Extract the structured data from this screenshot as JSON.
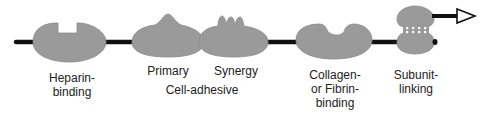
{
  "colors": {
    "domain_fill": "#9a9a9a",
    "domain_stroke": "#7a7a7a",
    "backbone": "#111111",
    "background": "#ffffff",
    "text": "#222222"
  },
  "domains": [
    {
      "id": "heparin-binding",
      "label_lines": [
        "Heparin-",
        "binding"
      ],
      "feature": "notch"
    },
    {
      "id": "primary",
      "label_lines": [
        "Primary"
      ],
      "feature": "single-peak"
    },
    {
      "id": "synergy",
      "label_lines": [
        "Synergy"
      ],
      "feature": "triple-peak"
    },
    {
      "id": "collagen-fibrin-binding",
      "label_lines": [
        "Collagen-",
        "or Fibrin-",
        "binding"
      ],
      "feature": "rounded-notch"
    },
    {
      "id": "subunit-linking",
      "label_lines": [
        "Subunit-",
        "linking"
      ],
      "feature": "disulfide-bonds"
    }
  ],
  "group_labels": [
    {
      "id": "cell-adhesive",
      "text": "Cell-adhesive",
      "groups": [
        "primary",
        "synergy"
      ]
    }
  ],
  "arrow": {
    "direction": "right",
    "meaning": "chain continues"
  }
}
